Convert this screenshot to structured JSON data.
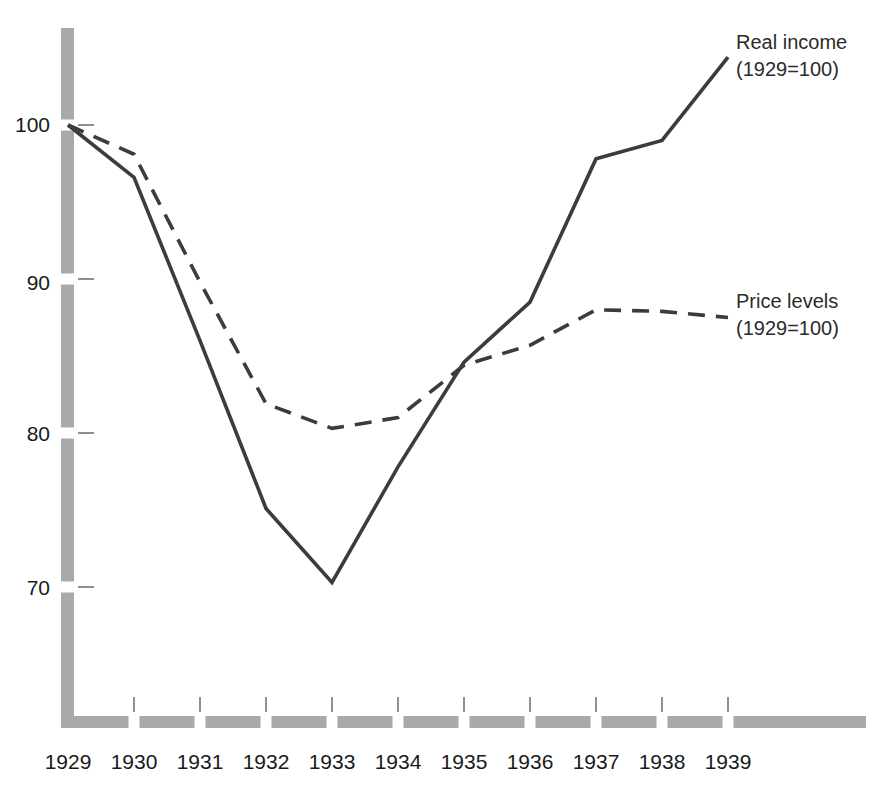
{
  "chart_data": {
    "type": "line",
    "title": "",
    "subtitle": "",
    "xlabel": "",
    "ylabel": "",
    "categories": [
      "1929",
      "1930",
      "1931",
      "1932",
      "1933",
      "1934",
      "1935",
      "1936",
      "1937",
      "1938",
      "1939"
    ],
    "x": [
      1929,
      1930,
      1931,
      1932,
      1933,
      1934,
      1935,
      1936,
      1937,
      1938,
      1939
    ],
    "xlim": [
      1929,
      1939
    ],
    "ylim": [
      62,
      106
    ],
    "y_ticks": [
      70,
      80,
      90,
      100
    ],
    "y_tick_labels": [
      "70",
      "80",
      "90",
      "100"
    ],
    "x_tick_labels": [
      "1929",
      "1930",
      "1931",
      "1932",
      "1933",
      "1934",
      "1935",
      "1936",
      "1937",
      "1938",
      "1939"
    ],
    "grid": false,
    "legend_position": "inline-annotation",
    "series": [
      {
        "name": "Real income (1929=100)",
        "label_line1": "Real income",
        "label_line2": "(1929=100)",
        "style": "solid",
        "color": "#3c3c3c",
        "values": [
          100.0,
          96.6,
          86.0,
          75.1,
          70.3,
          77.8,
          84.6,
          88.5,
          97.8,
          99.0,
          104.4
        ]
      },
      {
        "name": "Price levels (1929=100)",
        "label_line1": "Price levels",
        "label_line2": "(1929=100)",
        "style": "dashed",
        "color": "#3c3c3c",
        "values": [
          100.0,
          98.1,
          89.8,
          81.9,
          80.3,
          81.0,
          84.4,
          85.7,
          88.0,
          87.9,
          87.5
        ]
      }
    ]
  },
  "axes": {
    "axis_bar_color": "#a9a9a9",
    "tick_mark_color": "#8f8f8f",
    "y_axis_name": "y-axis",
    "x_axis_name": "x-axis"
  },
  "annotations": {
    "real_income": {
      "line1": "Real income",
      "line2": "(1929=100)"
    },
    "price_levels": {
      "line1": "Price levels",
      "line2": "(1929=100)"
    }
  },
  "y_labels": [
    "100",
    "90",
    "80",
    "70"
  ],
  "x_labels": [
    "1929",
    "1930",
    "1931",
    "1932",
    "1933",
    "1934",
    "1935",
    "1936",
    "1937",
    "1938",
    "1939"
  ]
}
